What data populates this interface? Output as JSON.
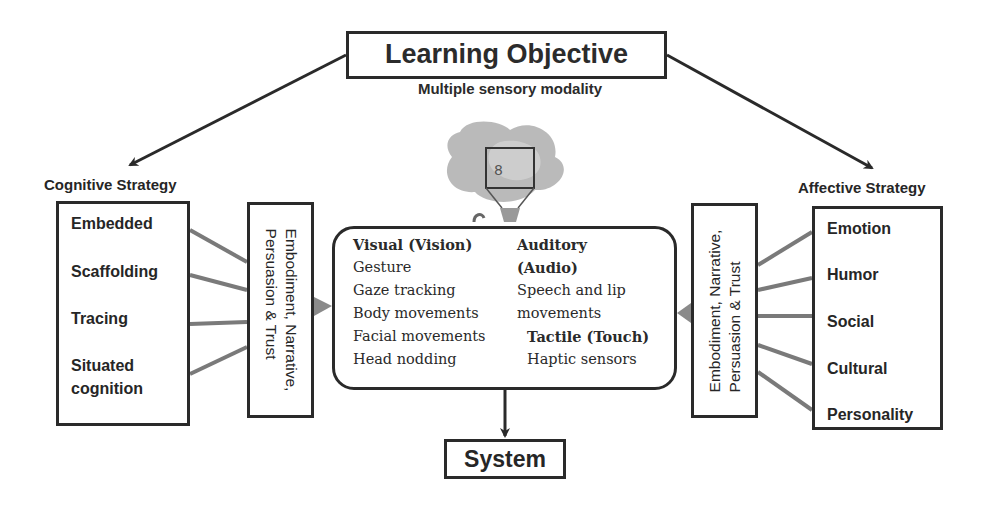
{
  "diagram": {
    "learning_objective": "Learning Objective",
    "modality_label": "Multiple sensory modality",
    "system": "System",
    "cognitive": {
      "title": "Cognitive Strategy",
      "items": [
        "Embedded",
        "Scaffolding",
        "Tracing",
        "Situated",
        "cognition"
      ],
      "mid_label_line1": "Embodiment, Narrative,",
      "mid_label_line2": "Persuasion & Trust"
    },
    "affective": {
      "title": "Affective Strategy",
      "items": [
        "Emotion",
        "Humor",
        "Social",
        "Cultural",
        "Personality"
      ],
      "mid_label_line1": "Embodiment, Narrative,",
      "mid_label_line2": "Persuasion & Trust"
    },
    "modalities": {
      "visual": {
        "heading": "Visual (Vision)",
        "items": [
          "Gesture",
          "Gaze tracking",
          "Body movements",
          "Facial movements",
          "Head nodding"
        ]
      },
      "auditory": {
        "heading_line1": "Auditory",
        "heading_line2": "(Audio)",
        "items": [
          "Speech and lip",
          "movements"
        ]
      },
      "tactile": {
        "heading": "Tactile (Touch)",
        "items": [
          "Haptic sensors"
        ]
      }
    },
    "robot_image": "robot-illustration"
  }
}
